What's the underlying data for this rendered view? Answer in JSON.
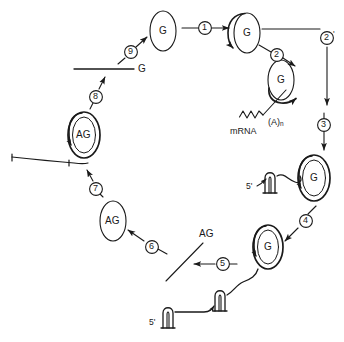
{
  "figure": {
    "kind": "diagram",
    "domain": "molecular-biology",
    "background_color": "#ffffff",
    "stroke_color": "#1a1a1a",
    "width": 344,
    "height": 342
  },
  "nodes": {
    "g_top": {
      "label": "G",
      "x": 163,
      "y": 31,
      "rx": 13,
      "ry": 20,
      "double": false,
      "loop_arrow": false
    },
    "g_step1": {
      "label": "G",
      "x": 247,
      "y": 33,
      "rx": 13,
      "ry": 20,
      "double": false,
      "loop_arrow": true
    },
    "g_step2": {
      "label": "G",
      "x": 281,
      "y": 80,
      "rx": 13,
      "ry": 20,
      "double": false,
      "loop_arrow": true
    },
    "g_step3": {
      "label": "G",
      "x": 314,
      "y": 178,
      "rx": 15,
      "ry": 22,
      "double": true,
      "loop_arrow": true
    },
    "g_step4": {
      "label": "G",
      "x": 268,
      "y": 247,
      "rx": 14,
      "ry": 21,
      "double": true,
      "loop_arrow": true
    },
    "ag_step6": {
      "label": "AG",
      "x": 113,
      "y": 221,
      "rx": 13,
      "ry": 20,
      "double": false,
      "loop_arrow": false
    },
    "ag_step7": {
      "label": "AG",
      "x": 84,
      "y": 135,
      "rx": 15,
      "ry": 22,
      "double": true,
      "loop_arrow": true
    }
  },
  "steps": [
    {
      "id": "step-1",
      "label": "1",
      "x": 205,
      "y": 28
    },
    {
      "id": "step-2",
      "label": "2",
      "x": 277,
      "y": 51
    },
    {
      "id": "step-2-prime",
      "label": "2",
      "prime": "'",
      "x": 327,
      "y": 39
    },
    {
      "id": "step-3",
      "label": "3",
      "x": 324,
      "y": 125
    },
    {
      "id": "step-4",
      "label": "4",
      "x": 304,
      "y": 221
    },
    {
      "id": "step-5",
      "label": "5",
      "x": 222,
      "y": 264
    },
    {
      "id": "step-6",
      "label": "6",
      "x": 151,
      "y": 245
    },
    {
      "id": "step-7",
      "label": "7",
      "x": 96,
      "y": 187
    },
    {
      "id": "step-8",
      "label": "8",
      "x": 96,
      "y": 95
    },
    {
      "id": "step-9",
      "label": "9",
      "x": 130,
      "y": 52
    }
  ],
  "text_labels": {
    "g_line_label": {
      "text": "G",
      "x": 139,
      "y": 68
    },
    "ag_line_label": {
      "text": "AG",
      "x": 202,
      "y": 234
    },
    "mrna": {
      "text": "mRNA",
      "x": 232,
      "y": 131
    },
    "poly_a": {
      "text": "(A)",
      "sub": "n",
      "x": 272,
      "y": 123
    },
    "five_prime_right": {
      "text": "5'",
      "x": 249,
      "y": 186
    },
    "five_prime_bottom": {
      "text": "5'",
      "x": 152,
      "y": 322
    }
  }
}
